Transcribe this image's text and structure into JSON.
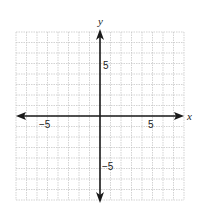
{
  "chart_data": {
    "type": "coordinate-grid",
    "title": "",
    "xlabel": "x",
    "ylabel": "y",
    "xlim": [
      -8,
      8
    ],
    "ylim": [
      -8,
      8
    ],
    "grid": true,
    "grid_step": 1,
    "x_tick_labels": [
      {
        "value": -5,
        "label": "−5"
      },
      {
        "value": 5,
        "label": "5"
      }
    ],
    "y_tick_labels": [
      {
        "value": 5,
        "label": "5"
      },
      {
        "value": -5,
        "label": "−5"
      }
    ],
    "series": []
  },
  "labels": {
    "x_axis": "x",
    "y_axis": "y",
    "x_neg5": "−5",
    "x_pos5": "5",
    "y_pos5": "5",
    "y_neg5": "−5"
  },
  "colors": {
    "grid": "#c8c8c8",
    "axis": "#1a1a1a",
    "background": "#ffffff"
  }
}
